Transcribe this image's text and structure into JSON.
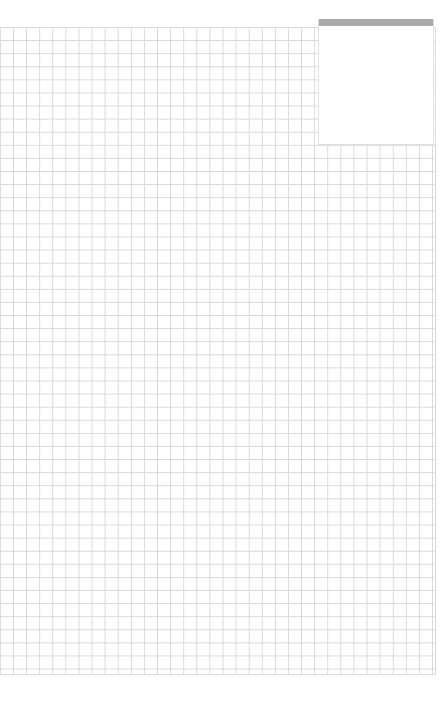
{
  "page": {
    "type": "graph-paper",
    "background_color": "#ffffff",
    "grid_line_color": "#d9d9d9",
    "cell_size_px": 13,
    "columns": 33,
    "rows": 49
  },
  "note_box": {
    "header_color": "#a9a9a9",
    "text": ""
  }
}
